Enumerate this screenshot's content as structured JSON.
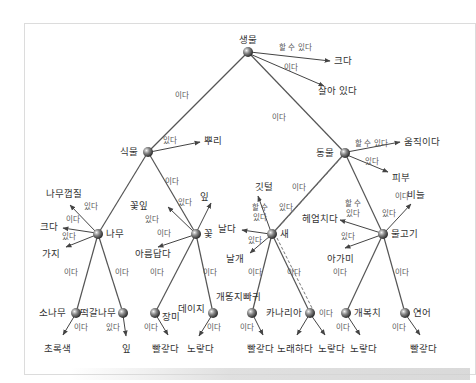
{
  "diagram": {
    "type": "semantic-network",
    "colors": {
      "line": "#555555",
      "node": "#6e6e6e",
      "text": "#333333",
      "edge_text": "#555555"
    },
    "nodes": {
      "root": "생물",
      "plant": "식물",
      "animal": "동물",
      "tree": "나무",
      "flower": "꽃",
      "bird": "새",
      "fish": "물고기",
      "pine": "소나무",
      "oak": "떡갈나무",
      "rose": "장미",
      "daisy": "데이지",
      "robin": "개똥지빠귀",
      "canary": "카나리아",
      "sunfish": "개복치",
      "salmon": "연어"
    },
    "properties": {
      "big_root": "크다",
      "alive": "살아 있다",
      "roots": "뿌리",
      "move": "움직이다",
      "skin": "피부",
      "bark": "나무껍질",
      "big_tree": "크다",
      "branches": "가지",
      "petals": "꽃잎",
      "leaf_flower": "잎",
      "pretty": "아름답다",
      "feathers": "깃털",
      "fly": "날다",
      "wings": "날개",
      "swim": "헤엄치다",
      "gills": "아가미",
      "scales": "비늘",
      "green": "초록색",
      "leaves_oak": "잎",
      "red_rose": "빨갛다",
      "yellow_daisy": "노랗다",
      "red_robin": "빨갛다",
      "sing": "노래하다",
      "yellow_canary": "노랗다",
      "yellow_sunfish": "노랗다",
      "red_salmon": "빨갛다"
    },
    "relations": {
      "isa": "이다",
      "has": "있다",
      "can": "할 수 있다",
      "can_split_1": "할 수",
      "can_split_2": "있다"
    }
  }
}
